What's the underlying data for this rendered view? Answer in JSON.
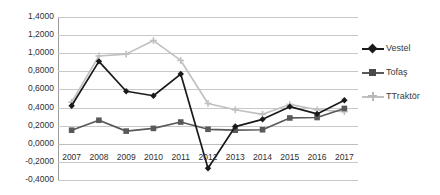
{
  "chart_data": {
    "type": "line",
    "title": "",
    "subtitle": "",
    "xlabel": "",
    "ylabel": "",
    "categories": [
      "2007",
      "2008",
      "2009",
      "2010",
      "2011",
      "2012",
      "2013",
      "2014",
      "2015",
      "2016",
      "2017"
    ],
    "ylim": [
      -0.4,
      1.4
    ],
    "ytick_step": 0.2,
    "ytick_labels": [
      "1,4000",
      "1,2000",
      "1,0000",
      "0,8000",
      "0,6000",
      "0,4000",
      "0,2000",
      "0,0000",
      "-0,2000",
      "-0,4000"
    ],
    "ytick_values": [
      1.4,
      1.2,
      1.0,
      0.8,
      0.6,
      0.4,
      0.2,
      0.0,
      -0.2,
      -0.4
    ],
    "grid": true,
    "legend_position": "right",
    "decimal_separator": ",",
    "series": [
      {
        "name": "Vestel",
        "color": "#1a1a1a",
        "marker": "diamond",
        "values": [
          0.42,
          0.91,
          0.58,
          0.53,
          0.77,
          -0.27,
          0.19,
          0.27,
          0.41,
          0.33,
          0.48
        ]
      },
      {
        "name": "Tofaş",
        "color": "#595959",
        "marker": "square",
        "values": [
          0.15,
          0.26,
          0.14,
          0.17,
          0.24,
          0.16,
          0.15,
          0.155,
          0.285,
          0.29,
          0.39
        ]
      },
      {
        "name": "TTraktör",
        "color": "#c0c0c0",
        "marker": "cross",
        "values": [
          0.46,
          0.97,
          0.99,
          1.14,
          0.92,
          0.445,
          0.375,
          0.325,
          0.435,
          0.375,
          0.355
        ]
      }
    ]
  },
  "legend": {
    "items": [
      {
        "label": "Vestel"
      },
      {
        "label": "Tofaş"
      },
      {
        "label": "TTraktör"
      }
    ]
  }
}
